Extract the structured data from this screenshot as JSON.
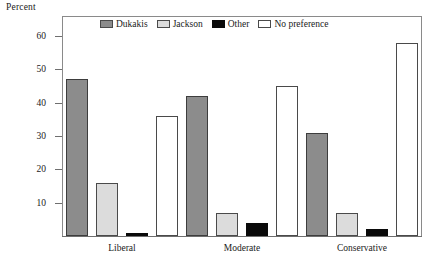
{
  "chart_data": {
    "type": "bar",
    "title": "",
    "ylabel": "Percent",
    "xlabel": "",
    "categories": [
      "Liberal",
      "Moderate",
      "Conservative"
    ],
    "series": [
      {
        "name": "Dukakis",
        "key": "dukakis",
        "color": "#8c8c8c",
        "values": [
          47,
          42,
          31
        ]
      },
      {
        "name": "Jackson",
        "key": "jackson",
        "color": "#dcdcdc",
        "values": [
          16,
          7,
          7
        ]
      },
      {
        "name": "Other",
        "key": "other",
        "color": "#0a0a0a",
        "values": [
          1,
          4,
          2
        ]
      },
      {
        "name": "No preference",
        "key": "nopref",
        "color": "#ffffff",
        "values": [
          36,
          45,
          58
        ]
      }
    ],
    "ylim": [
      0,
      66
    ],
    "yticks": [
      10,
      20,
      30,
      40,
      50,
      60
    ],
    "ytick_labels": [
      "10",
      "20",
      "30",
      "40",
      "50",
      "60"
    ],
    "grid": false,
    "legend_position": "top-inside"
  },
  "legend": {
    "entries": [
      {
        "label": "Dukakis",
        "swatch": "swatch-dukakis"
      },
      {
        "label": "Jackson",
        "swatch": "swatch-jackson"
      },
      {
        "label": "Other",
        "swatch": "swatch-other"
      },
      {
        "label": "No preference",
        "swatch": "swatch-nopref"
      }
    ]
  }
}
